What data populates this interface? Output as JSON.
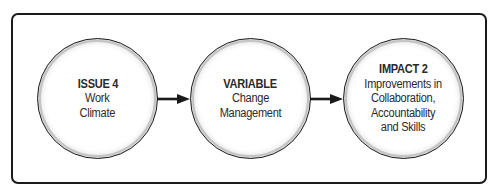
{
  "diagram": {
    "type": "flow",
    "nodes": [
      {
        "id": "issue",
        "title": "ISSUE 4",
        "body": "Work\nClimate"
      },
      {
        "id": "variable",
        "title": "VARIABLE",
        "body": "Change\nManagement"
      },
      {
        "id": "impact",
        "title": "IMPACT 2",
        "body": "Improvements in\nCollaboration,\nAccountability\nand Skills"
      }
    ],
    "edges": [
      {
        "from": "issue",
        "to": "variable"
      },
      {
        "from": "variable",
        "to": "impact"
      }
    ],
    "colors": {
      "stroke": "#1a1a1a",
      "text": "#2a2a2a",
      "fill": "#ffffff",
      "bevel": "#c4c4c4"
    }
  }
}
